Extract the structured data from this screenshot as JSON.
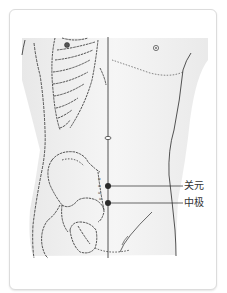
{
  "figure": {
    "colors": {
      "card_border": "#dcdcdc",
      "shading": "#ececec",
      "line": "#2a2a2a",
      "point": "#2b2b2b",
      "label_text": "#333333"
    },
    "points": [
      {
        "name": "关元",
        "x": 108,
        "y": 186
      },
      {
        "name": "中极",
        "x": 108,
        "y": 203
      }
    ],
    "labels": {
      "guanyuan": "关元",
      "zhongji": "中极"
    }
  }
}
